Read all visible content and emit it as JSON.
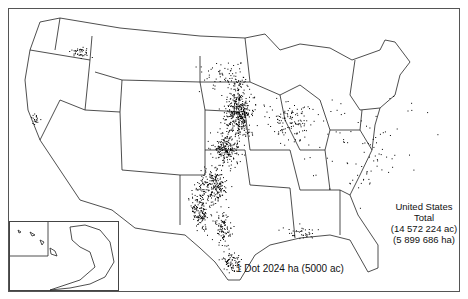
{
  "map": {
    "type": "dot-density",
    "region": "United States",
    "legend": {
      "total_label_line1": "United States",
      "total_label_line2": "Total",
      "total_acres": "(14 572 224 ac)",
      "total_hectares": "(5 899 686 ha)",
      "dot_value": "1 Dot 2024 ha (5000 ac)"
    },
    "insets": [
      "Alaska",
      "Hawaii"
    ],
    "dot_color": "#000000",
    "border_color": "#222222",
    "clusters": [
      {
        "name": "eastern-nebraska-kansas",
        "cx": 238,
        "cy": 112,
        "rx": 14,
        "ry": 30,
        "n": 420
      },
      {
        "name": "central-kansas",
        "cx": 225,
        "cy": 148,
        "rx": 14,
        "ry": 18,
        "n": 220
      },
      {
        "name": "western-oklahoma",
        "cx": 213,
        "cy": 185,
        "rx": 14,
        "ry": 18,
        "n": 220
      },
      {
        "name": "texas-panhandle",
        "cx": 200,
        "cy": 210,
        "rx": 10,
        "ry": 20,
        "n": 160
      },
      {
        "name": "central-texas",
        "cx": 222,
        "cy": 228,
        "rx": 8,
        "ry": 18,
        "n": 100
      },
      {
        "name": "texas-gulf",
        "cx": 230,
        "cy": 262,
        "rx": 10,
        "ry": 10,
        "n": 80
      },
      {
        "name": "iowa-illinois",
        "cx": 290,
        "cy": 120,
        "rx": 25,
        "ry": 20,
        "n": 120
      },
      {
        "name": "dakotas",
        "cx": 225,
        "cy": 75,
        "rx": 25,
        "ry": 18,
        "n": 70
      },
      {
        "name": "washington-palouse",
        "cx": 80,
        "cy": 52,
        "rx": 12,
        "ry": 6,
        "n": 40
      },
      {
        "name": "california-central",
        "cx": 35,
        "cy": 118,
        "rx": 4,
        "ry": 6,
        "n": 20
      },
      {
        "name": "scattered-east",
        "cx": 360,
        "cy": 150,
        "rx": 60,
        "ry": 50,
        "n": 90
      },
      {
        "name": "louisiana-coast",
        "cx": 300,
        "cy": 232,
        "rx": 20,
        "ry": 8,
        "n": 40
      }
    ]
  }
}
